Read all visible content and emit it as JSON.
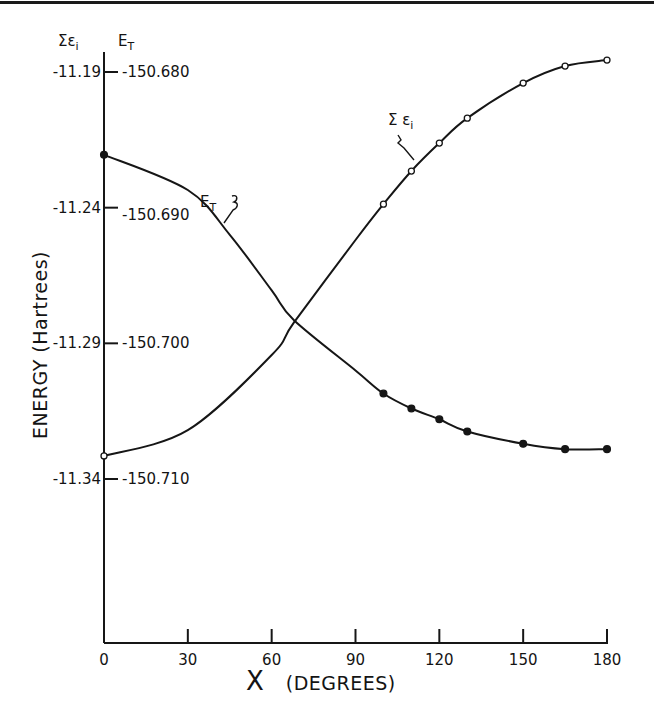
{
  "chart_data": {
    "type": "line",
    "title": "",
    "xlabel": "X (DEGREES)",
    "ylabel": "ENERGY (Hartrees)",
    "xlim": [
      0,
      180
    ],
    "x_ticks": [
      0,
      30,
      60,
      90,
      120,
      150,
      180
    ],
    "y_axes": {
      "left_inner": {
        "header": "Σε",
        "header_sub": "i",
        "range": [
          -11.34,
          -11.19
        ],
        "ticks": [
          "-11.19",
          "-11.24",
          "-11.29",
          "-11.34"
        ]
      },
      "left_outer": {
        "header": "E",
        "header_sub": "T",
        "range": [
          -150.71,
          -150.68
        ],
        "ticks": [
          "-150.680",
          "-150.690",
          "-150.700",
          "-150.710"
        ]
      }
    },
    "grid": false,
    "legend": "inline labels",
    "series": [
      {
        "name": "Σεi",
        "label": "Σ ε",
        "label_sub": "i",
        "axis": "left_inner",
        "marker": "open-circle",
        "points": [
          {
            "x": 0,
            "y": -11.3315
          },
          {
            "x": 100,
            "y": -11.2387
          },
          {
            "x": 110,
            "y": -11.2265
          },
          {
            "x": 120,
            "y": -11.2162
          },
          {
            "x": 130,
            "y": -11.207
          },
          {
            "x": 150,
            "y": -11.1941
          },
          {
            "x": 165,
            "y": -11.1878
          },
          {
            "x": 180,
            "y": -11.1856
          }
        ],
        "curve": [
          {
            "x": 0,
            "y": -11.3315
          },
          {
            "x": 30,
            "y": -11.322
          },
          {
            "x": 60,
            "y": -11.2943
          },
          {
            "x": 68,
            "y": -11.2823
          },
          {
            "x": 90,
            "y": -11.2519
          },
          {
            "x": 100,
            "y": -11.2387
          },
          {
            "x": 110,
            "y": -11.2265
          },
          {
            "x": 120,
            "y": -11.2162
          },
          {
            "x": 130,
            "y": -11.207
          },
          {
            "x": 150,
            "y": -11.1941
          },
          {
            "x": 165,
            "y": -11.1878
          },
          {
            "x": 180,
            "y": -11.1856
          }
        ]
      },
      {
        "name": "E_T",
        "label": "E",
        "label_sub": "T",
        "axis": "left_outer",
        "marker": "filled-circle",
        "points": [
          {
            "x": 0,
            "y": -150.6861
          },
          {
            "x": 100,
            "y": -150.7037
          },
          {
            "x": 110,
            "y": -150.7048
          },
          {
            "x": 120,
            "y": -150.7056
          },
          {
            "x": 130,
            "y": -150.7065
          },
          {
            "x": 150,
            "y": -150.7074
          },
          {
            "x": 165,
            "y": -150.7078
          },
          {
            "x": 180,
            "y": -150.7078
          }
        ],
        "curve": [
          {
            "x": 0,
            "y": -150.6861
          },
          {
            "x": 30,
            "y": -150.6887
          },
          {
            "x": 45,
            "y": -150.692
          },
          {
            "x": 60,
            "y": -150.6961
          },
          {
            "x": 68,
            "y": -150.6983
          },
          {
            "x": 90,
            "y": -150.702
          },
          {
            "x": 100,
            "y": -150.7037
          },
          {
            "x": 110,
            "y": -150.7048
          },
          {
            "x": 120,
            "y": -150.7056
          },
          {
            "x": 130,
            "y": -150.7065
          },
          {
            "x": 150,
            "y": -150.7074
          },
          {
            "x": 165,
            "y": -150.7078
          },
          {
            "x": 180,
            "y": -150.7078
          }
        ]
      }
    ]
  }
}
